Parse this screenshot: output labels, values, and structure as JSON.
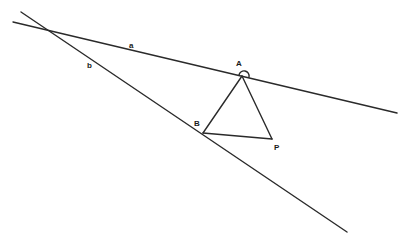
{
  "diagram": {
    "type": "geometry",
    "lines": [
      {
        "name": "a",
        "label": "a",
        "from": [
          13,
          22
        ],
        "to": [
          397,
          113
        ]
      },
      {
        "name": "b",
        "label": "b",
        "from": [
          21,
          12
        ],
        "to": [
          347,
          232
        ]
      }
    ],
    "points": [
      {
        "name": "A",
        "label": "A",
        "x": 242,
        "y": 76
      },
      {
        "name": "B",
        "label": "B",
        "x": 203,
        "y": 133
      },
      {
        "name": "P",
        "label": "P",
        "x": 272,
        "y": 139
      }
    ],
    "segments": [
      [
        "A",
        "B"
      ],
      [
        "A",
        "P"
      ],
      [
        "B",
        "P"
      ]
    ],
    "angle_marks": [
      {
        "at": "A",
        "between": [
          "line a",
          "AP"
        ]
      }
    ],
    "labels": {
      "a": "a",
      "b": "b",
      "A": "A",
      "B": "B",
      "P": "P"
    },
    "colors": {
      "stroke": "#2a2a2a",
      "background": "#ffffff"
    }
  }
}
